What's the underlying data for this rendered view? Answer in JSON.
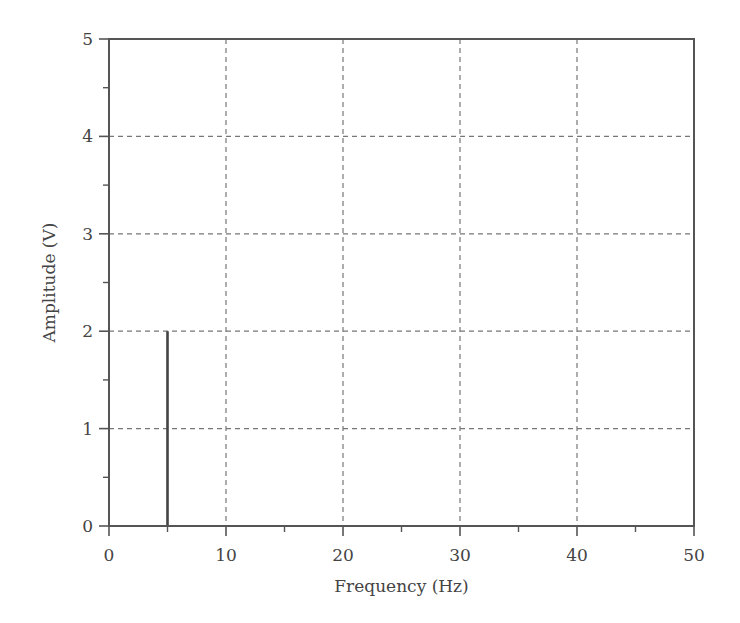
{
  "chart_data": {
    "type": "line",
    "title": "",
    "xlabel": "Frequency (Hz)",
    "ylabel": "Amplitude (V)",
    "xlim": [
      0,
      50
    ],
    "ylim": [
      0,
      5
    ],
    "x_ticks": [
      0,
      10,
      20,
      30,
      40,
      50
    ],
    "x_tick_labels": [
      "0",
      "10",
      "20",
      "30",
      "40",
      "50"
    ],
    "x_minor_ticks": [
      5,
      15,
      25,
      35,
      45
    ],
    "y_ticks": [
      0,
      1,
      2,
      3,
      4,
      5
    ],
    "y_tick_labels": [
      "0",
      "1",
      "2",
      "3",
      "4",
      "5"
    ],
    "y_minor_ticks": [
      0.5,
      1.5,
      2.5,
      3.5,
      4.5
    ],
    "grid": true,
    "grid_style": "dashed",
    "legend": null,
    "series": [
      {
        "name": "Amplitude spectrum",
        "x": [
          0,
          4.9,
          5,
          5.1,
          50
        ],
        "y": [
          0,
          0,
          2,
          0,
          0
        ],
        "color": "#444444"
      }
    ],
    "annotations": [
      {
        "type": "spike",
        "frequency_hz": 5,
        "amplitude_v": 2
      }
    ]
  },
  "colors": {
    "axis": "#555555",
    "grid": "#777777",
    "series": "#444444",
    "text": "#444444"
  }
}
